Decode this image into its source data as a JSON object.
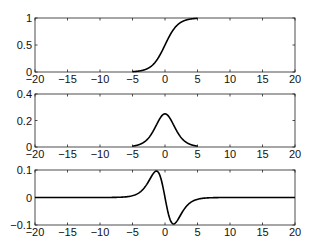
{
  "chart_data": [
    {
      "type": "line",
      "title": "",
      "xlabel": "",
      "ylabel": "",
      "xlim": [
        -20,
        20
      ],
      "ylim": [
        0,
        1
      ],
      "xticks": [
        -20,
        -15,
        -10,
        -5,
        0,
        5,
        10,
        15,
        20
      ],
      "xtick_labels": [
        "-20",
        "-15",
        "-10",
        "-5",
        "0",
        "5",
        "10",
        "15",
        "20"
      ],
      "yticks": [
        0,
        0.5,
        1
      ],
      "ytick_labels": [
        "0",
        "0.5",
        "1"
      ],
      "grid": false,
      "series": [
        {
          "name": "sigmoid",
          "x": [
            -5,
            -4,
            -3,
            -2,
            -1,
            0,
            1,
            2,
            3,
            4,
            5
          ],
          "values": [
            0.007,
            0.018,
            0.047,
            0.119,
            0.269,
            0.5,
            0.731,
            0.881,
            0.953,
            0.982,
            0.993
          ]
        }
      ]
    },
    {
      "type": "line",
      "title": "",
      "xlabel": "",
      "ylabel": "",
      "xlim": [
        -20,
        20
      ],
      "ylim": [
        0,
        0.4
      ],
      "xticks": [
        -20,
        -15,
        -10,
        -5,
        0,
        5,
        10,
        15,
        20
      ],
      "xtick_labels": [
        "-20",
        "-15",
        "-10",
        "-5",
        "0",
        "5",
        "10",
        "15",
        "20"
      ],
      "yticks": [
        0,
        0.2,
        0.4
      ],
      "ytick_labels": [
        "0",
        "0.2",
        "0.4"
      ],
      "grid": false,
      "series": [
        {
          "name": "sigmoid first derivative",
          "x": [
            -5,
            -4,
            -3,
            -2,
            -1,
            0,
            1,
            2,
            3,
            4,
            5
          ],
          "values": [
            0.007,
            0.018,
            0.045,
            0.105,
            0.197,
            0.25,
            0.197,
            0.105,
            0.045,
            0.018,
            0.007
          ]
        }
      ]
    },
    {
      "type": "line",
      "title": "",
      "xlabel": "",
      "ylabel": "",
      "xlim": [
        -20,
        20
      ],
      "ylim": [
        -0.1,
        0.1
      ],
      "xticks": [
        -20,
        -15,
        -10,
        -5,
        0,
        5,
        10,
        15,
        20
      ],
      "xtick_labels": [
        "-20",
        "-15",
        "-10",
        "-5",
        "0",
        "5",
        "10",
        "15",
        "20"
      ],
      "yticks": [
        -0.1,
        0,
        0.1
      ],
      "ytick_labels": [
        "-0.1",
        "0",
        "0.1"
      ],
      "grid": false,
      "series": [
        {
          "name": "sigmoid second derivative",
          "x": [
            -20,
            -10,
            -6,
            -5,
            -4,
            -3,
            -2,
            -1.32,
            -1,
            0,
            1,
            1.32,
            2,
            3,
            4,
            5,
            6,
            10,
            20
          ],
          "values": [
            0,
            0,
            0.002,
            0.007,
            0.017,
            0.042,
            0.083,
            0.096,
            0.091,
            0,
            -0.091,
            -0.096,
            -0.083,
            -0.042,
            -0.017,
            -0.007,
            -0.002,
            0,
            0
          ]
        }
      ]
    }
  ]
}
